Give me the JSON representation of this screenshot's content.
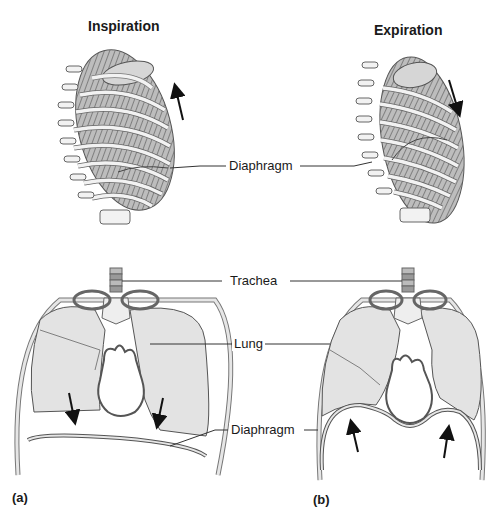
{
  "titles": {
    "inspiration": "Inspiration",
    "expiration": "Expiration"
  },
  "labels": {
    "diaphragm_top": "Diaphragm",
    "trachea": "Trachea",
    "lung": "Lung",
    "diaphragm_bottom": "Diaphragm"
  },
  "panels": {
    "a": "(a)",
    "b": "(b)"
  },
  "colors": {
    "lung_fill": "#e3e3e3",
    "outline": "#555555",
    "rib_fill": "#f2f2f2",
    "rib_shadow": "#9a9a9a",
    "arrow": "#111111"
  },
  "arrows": {
    "inspiration_ribcage": "up",
    "expiration_ribcage": "down",
    "inspiration_diaphragm": "down",
    "expiration_diaphragm": "up"
  }
}
